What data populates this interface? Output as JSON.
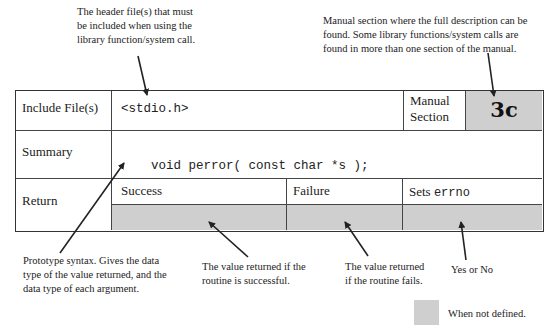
{
  "annotations": {
    "header_files": [
      "The header file(s) that must",
      "be included when using the",
      "library function/system call."
    ],
    "manual_section": [
      "Manual section where the full description can be",
      "found. Some library functions/system calls are",
      "found in more than one section of the manual."
    ],
    "prototype": [
      "Prototype syntax. Gives the data",
      "type of the value returned, and the",
      "data type of each argument."
    ],
    "success": [
      "The value returned if the",
      "routine is successful."
    ],
    "failure": [
      "The value returned",
      "if the routine fails."
    ],
    "sets_errno": [
      "Yes or No"
    ]
  },
  "table": {
    "include_label": "Include File(s)",
    "include_value": "<stdio.h>",
    "manual_label_line1": "Manual",
    "manual_label_line2": "Section",
    "manual_value": "3c",
    "summary_label": "Summary",
    "summary_value": "void perror( const char *s );",
    "return_label": "Return",
    "return_columns": {
      "success": "Success",
      "failure": "Failure",
      "sets_prefix": "Sets ",
      "sets_code": "errno"
    }
  },
  "legend": {
    "label": "When not defined.",
    "swatch_color": "#cfcfcf"
  }
}
